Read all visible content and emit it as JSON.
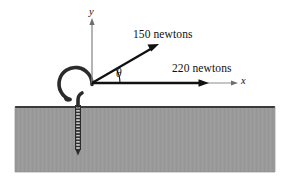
{
  "figure": {
    "type": "free-body-force-diagram",
    "forces": [
      {
        "id": "f1",
        "label": "150 newtons",
        "magnitude": 150,
        "unit": "newtons",
        "angle_deg": 30,
        "direction": "up-right"
      },
      {
        "id": "f2",
        "label": "220 newtons",
        "magnitude": 220,
        "unit": "newtons",
        "angle_deg": 0,
        "direction": "right"
      }
    ],
    "axes": {
      "x_label": "x",
      "y_label": "y"
    },
    "angle": {
      "symbol": "θ",
      "between": [
        "150 newtons",
        "x"
      ]
    },
    "object": {
      "name": "screw-hook",
      "embedded_in": "ground-block"
    },
    "colors": {
      "ground_fill": "#9a9a9a",
      "ground_edge": "#3a3a3a",
      "vector_stroke": "#111111",
      "axis_stroke": "#8c8c8c",
      "hook_stroke": "#2b2b2b",
      "background": "#ffffff"
    }
  }
}
